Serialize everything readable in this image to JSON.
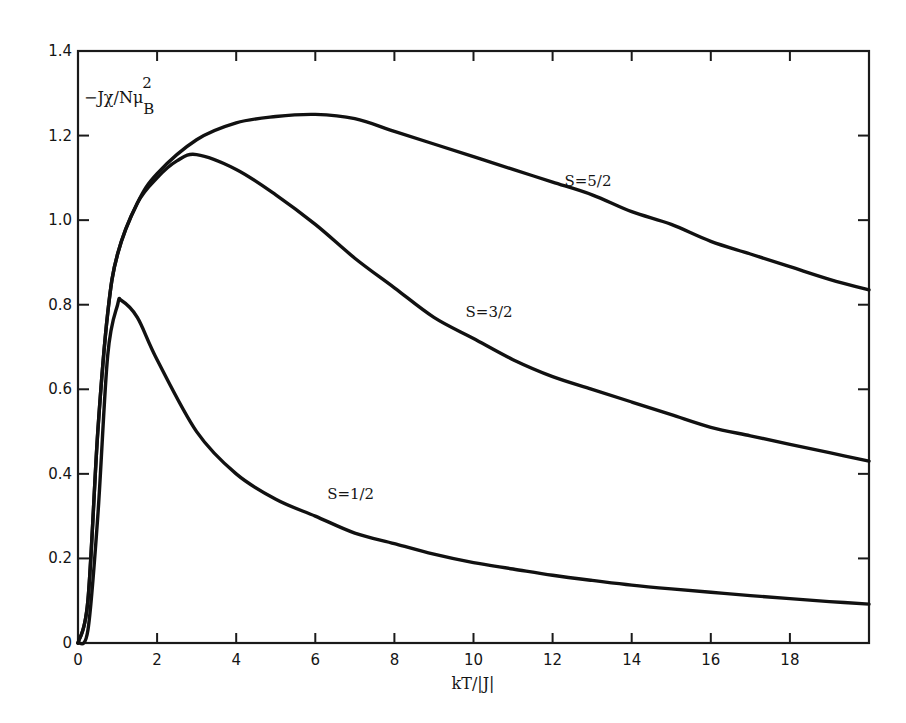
{
  "chart_data": {
    "type": "line",
    "title": "",
    "xlabel": "kT/|J|",
    "ylabel": "-Jχ/Nμ_B^2",
    "ylabel_parts": {
      "main": "−Jχ/Nμ",
      "sub": "B",
      "sup": "2"
    },
    "xlim": [
      0,
      20
    ],
    "ylim": [
      0,
      1.4
    ],
    "x_ticks": [
      0,
      2,
      4,
      6,
      8,
      10,
      12,
      14,
      16,
      18,
      20
    ],
    "x_tick_labels": [
      "0",
      "2",
      "4",
      "6",
      "8",
      "10",
      "12",
      "14",
      "16",
      "18"
    ],
    "y_ticks": [
      0,
      0.2,
      0.4,
      0.6,
      0.8,
      1.0,
      1.2,
      1.4
    ],
    "y_tick_labels": [
      "0",
      "0.2",
      "0.4",
      "0.6",
      "0.8",
      "1.0",
      "1.2",
      "1.4"
    ],
    "grid": false,
    "legend": "inline labels",
    "series": [
      {
        "name": "S=5/2",
        "label_pos": {
          "x": 12.3,
          "y": 1.08
        },
        "x": [
          0,
          0.25,
          0.5,
          0.75,
          1,
          1.5,
          2,
          3,
          4,
          5,
          6,
          7,
          8,
          9,
          10,
          11,
          12,
          13,
          14,
          15,
          16,
          17,
          18,
          19,
          20
        ],
        "values": [
          0,
          0.1,
          0.5,
          0.78,
          0.92,
          1.04,
          1.11,
          1.19,
          1.23,
          1.245,
          1.25,
          1.24,
          1.21,
          1.18,
          1.15,
          1.12,
          1.09,
          1.06,
          1.02,
          0.99,
          0.95,
          0.92,
          0.89,
          0.86,
          0.835
        ]
      },
      {
        "name": "S=3/2",
        "label_pos": {
          "x": 9.8,
          "y": 0.77
        },
        "x": [
          0,
          0.25,
          0.5,
          0.75,
          1,
          1.5,
          2,
          2.5,
          3,
          4,
          5,
          6,
          7,
          8,
          9,
          10,
          11,
          12,
          13,
          14,
          15,
          16,
          17,
          18,
          19,
          20
        ],
        "values": [
          0,
          0.1,
          0.5,
          0.78,
          0.92,
          1.04,
          1.1,
          1.14,
          1.155,
          1.12,
          1.06,
          0.99,
          0.91,
          0.84,
          0.77,
          0.72,
          0.67,
          0.63,
          0.6,
          0.57,
          0.54,
          0.51,
          0.49,
          0.47,
          0.45,
          0.43
        ]
      },
      {
        "name": "S=1/2",
        "label_pos": {
          "x": 6.3,
          "y": 0.34
        },
        "x": [
          0,
          0.25,
          0.5,
          0.75,
          1,
          1.1,
          1.5,
          2,
          3,
          4,
          5,
          6,
          7,
          8,
          9,
          10,
          11,
          12,
          13,
          14,
          15,
          16,
          17,
          18,
          19,
          20
        ],
        "values": [
          0,
          0.03,
          0.3,
          0.68,
          0.8,
          0.81,
          0.77,
          0.67,
          0.5,
          0.4,
          0.34,
          0.3,
          0.26,
          0.235,
          0.21,
          0.19,
          0.175,
          0.16,
          0.148,
          0.137,
          0.128,
          0.12,
          0.112,
          0.105,
          0.098,
          0.092
        ]
      }
    ]
  },
  "colors": {
    "line": "#111111",
    "axis": "#1a1a1a",
    "background": "#ffffff"
  }
}
